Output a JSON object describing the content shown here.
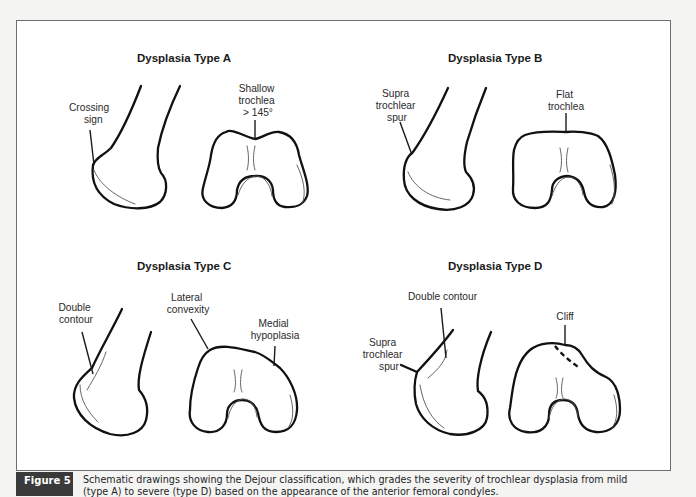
{
  "figure": {
    "label": "Figure 5",
    "caption_line1": "Schematic drawings showing the Dejour classification, which grades the severity of trochlear dysplasia from mild",
    "caption_line2": "(type A) to severe (type D) based on the appearance of the anterior femoral condyles."
  },
  "panels": [
    {
      "title": "Dysplasia Type A",
      "labels": {
        "lateral": [
          "Crossing",
          "sign"
        ],
        "axial": [
          "Shallow",
          "trochlea",
          "> 145°"
        ]
      }
    },
    {
      "title": "Dysplasia Type B",
      "labels": {
        "lateral": [
          "Supra",
          "trochlear",
          "spur"
        ],
        "axial": [
          "Flat",
          "trochlea"
        ]
      }
    },
    {
      "title": "Dysplasia Type C",
      "labels": {
        "lateral": [
          "Double",
          "contour"
        ],
        "axial_left": [
          "Lateral",
          "convexity"
        ],
        "axial_right": [
          "Medial",
          "hypoplasia"
        ]
      }
    },
    {
      "title": "Dysplasia Type D",
      "labels": {
        "lateral_top": [
          "Double contour"
        ],
        "lateral_side": [
          "Supra",
          "trochlear",
          "spur"
        ],
        "axial": [
          "Cliff"
        ]
      }
    }
  ],
  "colors": {
    "caption_label_bg": "#3a3a3a",
    "frame_border": "#6e6e6e",
    "line": "#111111"
  }
}
